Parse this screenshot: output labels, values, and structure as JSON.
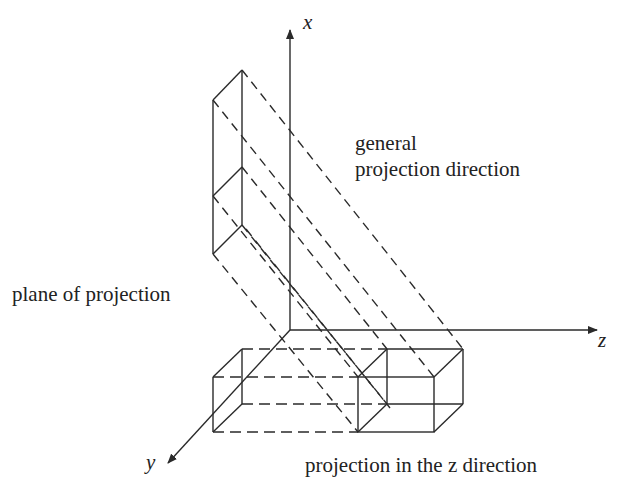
{
  "axes": {
    "x_label": "x",
    "y_label": "y",
    "z_label": "z"
  },
  "labels": {
    "general_line1": "general",
    "general_line2": "projection direction",
    "plane": "plane of projection",
    "projection_z": "projection in the z direction"
  },
  "colors": {
    "line": "#2a2a2a",
    "background": "#ffffff"
  }
}
